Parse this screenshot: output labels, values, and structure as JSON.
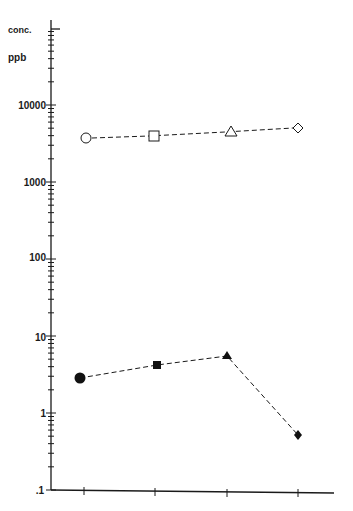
{
  "chart_data": {
    "type": "line",
    "title": "",
    "xlabel": "",
    "ylabel": "conc. ppb",
    "y_scale": "log",
    "ylim": [
      0.1,
      100000
    ],
    "y_tick_labels": [
      "10000",
      "1000",
      "100",
      "10",
      "1",
      ".1"
    ],
    "x_ticks": 4,
    "grid": false,
    "legend": null,
    "categories": [
      "1",
      "2",
      "3",
      "4"
    ],
    "series": [
      {
        "name": "upper series (open markers)",
        "markers": [
          "open-circle",
          "open-square",
          "open-triangle",
          "open-diamond"
        ],
        "line_style": "dashed",
        "values": [
          3700,
          4000,
          4400,
          5000
        ]
      },
      {
        "name": "lower series (filled markers)",
        "markers": [
          "filled-circle",
          "filled-square",
          "filled-triangle",
          "filled-diamond"
        ],
        "line_style": "dashed",
        "values": [
          2.8,
          4.2,
          5.5,
          0.5
        ]
      }
    ]
  },
  "labels": {
    "y_title_line1": "conc.",
    "y_title_line2": "ppb",
    "t10000": "10000",
    "t1000": "1000",
    "t100": "100",
    "t10": "10",
    "t1": "1",
    "t01": ".1"
  },
  "colors": {
    "ink": "#1a1a1a",
    "background": "#ffffff"
  }
}
